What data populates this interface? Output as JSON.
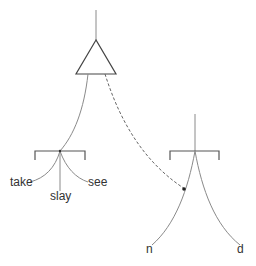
{
  "diagram": {
    "type": "tree-merge",
    "left_tree": {
      "root": "triangle",
      "leaves": [
        {
          "label": "take"
        },
        {
          "label": "slay"
        },
        {
          "label": "see"
        }
      ]
    },
    "right_tree": {
      "leaves": [
        {
          "label": "n"
        },
        {
          "label": "d"
        }
      ]
    },
    "connection": {
      "style": "dashed",
      "from": "triangle",
      "to": "right_tree_left_branch"
    },
    "colors": {
      "line": "#8a8a8a",
      "bracket": "#555555",
      "text": "#333333"
    }
  }
}
